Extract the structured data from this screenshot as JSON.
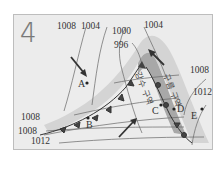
{
  "figure": {
    "number": "4",
    "type": "surface weather map (mid-latitude cyclone)"
  },
  "isobars": [
    {
      "label": "1008",
      "position": "top-left"
    },
    {
      "label": "1004",
      "position": "top"
    },
    {
      "label": "1000",
      "position": "top-center"
    },
    {
      "label": "996",
      "position": "center-low"
    },
    {
      "label": "1004",
      "position": "top-right"
    },
    {
      "label": "1008",
      "position": "right"
    },
    {
      "label": "1012",
      "position": "right-lower"
    },
    {
      "label": "1008",
      "position": "left"
    },
    {
      "label": "1008",
      "position": "bottom-left"
    },
    {
      "label": "1012",
      "position": "bottom-left"
    }
  ],
  "points": [
    {
      "id": "A",
      "label": "A"
    },
    {
      "id": "B",
      "label": "B"
    },
    {
      "id": "C",
      "label": "C"
    },
    {
      "id": "D",
      "label": "D"
    },
    {
      "id": "E",
      "label": "E"
    }
  ],
  "regions": {
    "precipitation_area": "강수 구역",
    "cloud_area": "구름 구역"
  },
  "fronts": {
    "cold_front": "cold front with triangles",
    "warm_front": "warm front with semicircles"
  },
  "colors": {
    "background": "#ececec",
    "precipitation_band": "#a9a9a9",
    "cloud_band": "#d2d2d2",
    "isobar": "#555555",
    "front": "#333333"
  }
}
